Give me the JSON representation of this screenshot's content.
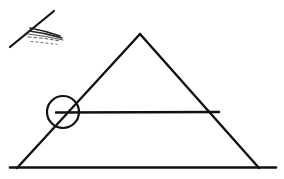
{
  "document": {
    "title": "Hand-drawn geometry sketch",
    "background_color": "#ffffff",
    "ink_color": "#111111",
    "width": 284,
    "height": 179
  },
  "chart_data": {
    "type": "diagram",
    "xlabel": "",
    "ylabel": "",
    "xlim": [
      0,
      284
    ],
    "ylim": [
      0,
      179
    ],
    "grid": false,
    "legend": "none",
    "shapes": [
      {
        "name": "base-line",
        "kind": "line",
        "stroke_width": 2.6,
        "points": [
          [
            10,
            167.5
          ],
          [
            276,
            167.5
          ]
        ]
      },
      {
        "name": "left-slope",
        "kind": "line",
        "stroke_width": 2.4,
        "points": [
          [
            17,
            168
          ],
          [
            140,
            34
          ]
        ]
      },
      {
        "name": "right-slope",
        "kind": "line",
        "stroke_width": 2.4,
        "points": [
          [
            140,
            34
          ],
          [
            259,
            168
          ]
        ]
      },
      {
        "name": "horizontal-chord",
        "kind": "line",
        "stroke_width": 2.4,
        "points": [
          [
            56,
            112.5
          ],
          [
            219,
            112.0
          ]
        ]
      },
      {
        "name": "intersection-circle",
        "kind": "circle",
        "stroke_width": 2.2,
        "center": [
          63,
          112
        ],
        "radius": 16
      },
      {
        "name": "bird-mark-upstroke",
        "kind": "line",
        "stroke_width": 2.2,
        "points": [
          [
            10,
            47
          ],
          [
            54,
            11
          ]
        ]
      },
      {
        "name": "bird-mark-feather-1",
        "kind": "curve",
        "stroke_width": 1.6,
        "points": [
          [
            30,
            28
          ],
          [
            46,
            31
          ],
          [
            60,
            36
          ]
        ]
      },
      {
        "name": "bird-mark-feather-2",
        "kind": "curve",
        "stroke_width": 1.4,
        "points": [
          [
            29,
            31
          ],
          [
            46,
            33
          ],
          [
            62,
            38
          ]
        ]
      },
      {
        "name": "bird-mark-feather-3",
        "kind": "curve",
        "stroke_width": 1.2,
        "points": [
          [
            28,
            34
          ],
          [
            46,
            36
          ],
          [
            63,
            40
          ]
        ]
      },
      {
        "name": "bird-mark-feather-4",
        "kind": "curve",
        "stroke_width": 1.0,
        "points": [
          [
            28,
            37
          ],
          [
            45,
            38
          ],
          [
            60,
            41
          ]
        ]
      }
    ],
    "annotations": []
  },
  "labels": {
    "caption": ""
  }
}
